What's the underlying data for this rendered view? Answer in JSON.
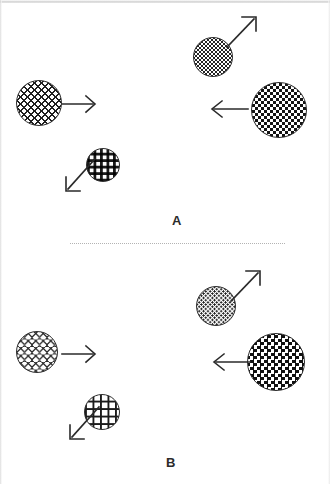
{
  "figure": {
    "width": 330,
    "height": 484,
    "background": "#ffffff",
    "ink_color": "#2a2a2a"
  },
  "divider": {
    "style": "dotted",
    "color": "#9a9a9a"
  },
  "panels": [
    {
      "id": "A",
      "label": "A",
      "label_x": 175,
      "label_y": 221,
      "elements": [
        {
          "name": "circle-large-hatched-left",
          "texture": "houndstooth",
          "shade": "dark",
          "cx": 39,
          "cy": 103,
          "diameter": 46,
          "arrow": "right"
        },
        {
          "name": "circle-stippled-top",
          "texture": "stipple",
          "shade": "medium",
          "cx": 213,
          "cy": 57,
          "diameter": 40,
          "arrow": "up-right"
        },
        {
          "name": "circle-largest-checkered-right",
          "texture": "checker-dense",
          "shade": "very-dark",
          "cx": 279,
          "cy": 110,
          "diameter": 56,
          "arrow": "left"
        },
        {
          "name": "circle-small-square-grid-bottom",
          "texture": "square-dots",
          "shade": "medium",
          "cx": 103,
          "cy": 165,
          "diameter": 34,
          "arrow": "down-left"
        }
      ],
      "arrows": [
        {
          "name": "arrow-right-a",
          "direction": "right",
          "x": 62,
          "y": 94,
          "length": 34
        },
        {
          "name": "arrow-up-right-a",
          "direction": "up-right",
          "x": 232,
          "y": 15,
          "length": 34
        },
        {
          "name": "arrow-left-a",
          "direction": "left",
          "x": 208,
          "y": 99,
          "length": 38
        },
        {
          "name": "arrow-down-left-a",
          "direction": "down-left",
          "x": 64,
          "y": 175,
          "length": 34
        }
      ]
    },
    {
      "id": "B",
      "label": "B",
      "label_x": 169,
      "label_y": 463,
      "elements": [
        {
          "name": "circle-light-hatched-left",
          "texture": "houndstooth-light",
          "shade": "light",
          "cx": 37,
          "cy": 352,
          "diameter": 42,
          "arrow": "right"
        },
        {
          "name": "circle-stippled-top",
          "texture": "stipple",
          "shade": "medium",
          "cx": 216,
          "cy": 306,
          "diameter": 40,
          "arrow": "up-right"
        },
        {
          "name": "circle-largest-checkered-right",
          "texture": "checker-diagonal",
          "shade": "very-dark",
          "cx": 276,
          "cy": 362,
          "diameter": 58,
          "arrow": "left"
        },
        {
          "name": "circle-open-grid-bottom",
          "texture": "grid-open",
          "shade": "medium",
          "cx": 102,
          "cy": 412,
          "diameter": 36,
          "arrow": "down-left"
        }
      ],
      "arrows": [
        {
          "name": "arrow-right-b",
          "direction": "right",
          "x": 62,
          "y": 344,
          "length": 34
        },
        {
          "name": "arrow-up-right-b",
          "direction": "up-right",
          "x": 236,
          "y": 268,
          "length": 32
        },
        {
          "name": "arrow-left-b",
          "direction": "left",
          "x": 210,
          "y": 352,
          "length": 38
        },
        {
          "name": "arrow-down-left-b",
          "direction": "down-left",
          "x": 68,
          "y": 424,
          "length": 34
        }
      ]
    }
  ]
}
